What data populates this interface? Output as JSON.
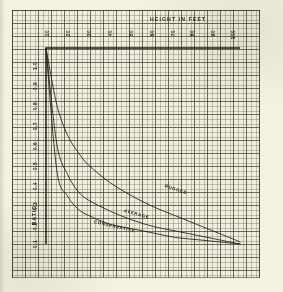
{
  "page": {
    "background_color": "#f4f1e3",
    "grid_color": "#3c3a2c",
    "ink_color": "#1f1e18"
  },
  "chart_data": {
    "type": "line",
    "title": "HEIGHT IN FEET",
    "xlabel": "HEIGHT IN FEET",
    "ylabel": "RATIO",
    "xlim": [
      10,
      100
    ],
    "ylim": [
      0.1,
      1.0
    ],
    "grid": true,
    "legend": "inline-curve-labels",
    "xticks": [
      "10",
      "20",
      "30",
      "40",
      "50",
      "60",
      "70",
      "80",
      "90",
      "100"
    ],
    "yticks": [
      "1.0",
      "0.9",
      "0.8",
      "0.7",
      "0.6",
      "0.5",
      "0.4",
      "0.3",
      "0.2",
      "0.1"
    ],
    "x": [
      10,
      15,
      20,
      25,
      30,
      40,
      50,
      60,
      70,
      80,
      90,
      100
    ],
    "series": [
      {
        "name": "RUGGED",
        "label": "RUGGED",
        "values": [
          1.0,
          0.74,
          0.6,
          0.52,
          0.46,
          0.38,
          0.32,
          0.27,
          0.23,
          0.19,
          0.15,
          0.11
        ]
      },
      {
        "name": "AVERAGE",
        "label": "AVERAGE",
        "values": [
          1.0,
          0.56,
          0.42,
          0.34,
          0.3,
          0.25,
          0.21,
          0.18,
          0.16,
          0.14,
          0.12,
          0.1
        ]
      },
      {
        "name": "CONSERVATIVE",
        "label": "CONSERVATIVE",
        "values": [
          1.0,
          0.44,
          0.32,
          0.26,
          0.23,
          0.19,
          0.17,
          0.15,
          0.13,
          0.12,
          0.11,
          0.1
        ]
      }
    ]
  },
  "annotations": {
    "rugged": "RUGGED",
    "average": "AVERAGE",
    "conservative": "CONSERVATIVE"
  }
}
